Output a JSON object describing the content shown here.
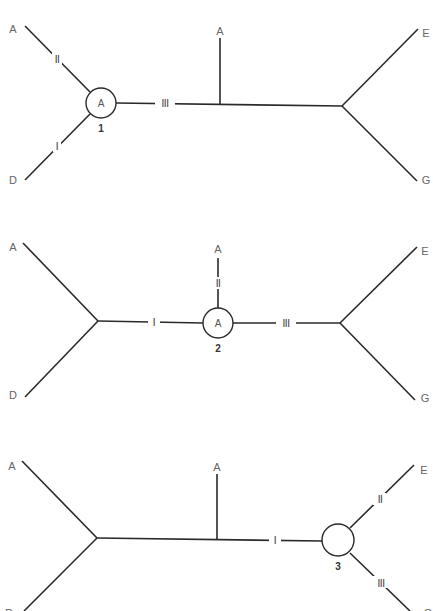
{
  "diagram": {
    "type": "unrooted phylogenetic trees (three alternative placements of ancestral node)",
    "colors": {
      "line": "#2a2a2a",
      "label": "#666666",
      "background": "#ffffff"
    },
    "trees": [
      {
        "id": 1,
        "node_label": "A",
        "node_number": "1",
        "leaves": {
          "top_left": "A",
          "bottom_left": "D",
          "top_middle": "A",
          "top_right": "E",
          "bottom_right": "G"
        },
        "branch_marks": {
          "upper_left": "II",
          "lower_left": "I",
          "center": "III"
        }
      },
      {
        "id": 2,
        "node_label": "A",
        "node_number": "2",
        "leaves": {
          "top_left": "A",
          "bottom_left": "D",
          "top_middle": "A",
          "top_right": "E",
          "bottom_right": "G"
        },
        "branch_marks": {
          "left": "I",
          "up": "II",
          "right": "III"
        }
      },
      {
        "id": 3,
        "node_label": "",
        "node_number": "3",
        "leaves": {
          "top_left": "A",
          "bottom_left": "D",
          "top_middle": "A",
          "top_right": "E",
          "bottom_right": "G"
        },
        "branch_marks": {
          "center": "I",
          "upper_right": "II",
          "lower_right": "III"
        }
      }
    ]
  }
}
